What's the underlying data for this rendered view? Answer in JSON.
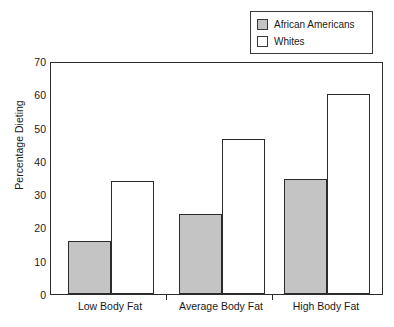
{
  "chart_data": {
    "type": "bar",
    "title": "",
    "subtitle": "",
    "xlabel": "",
    "ylabel": "Percentage Dieting",
    "categories": [
      "Low Body Fat",
      "Average Body Fat",
      "High Body Fat"
    ],
    "series": [
      {
        "name": "African Americans",
        "values": [
          16,
          24,
          34.5
        ],
        "color": "#c4c4c4"
      },
      {
        "name": "Whites",
        "values": [
          34,
          46.5,
          60
        ],
        "color": "#ffffff"
      }
    ],
    "ylim": [
      0,
      70
    ],
    "yticks": [
      0,
      10,
      20,
      30,
      40,
      50,
      60,
      70
    ],
    "ytick_labels": [
      "0",
      "10",
      "20",
      "30",
      "40",
      "50",
      "60",
      "70"
    ],
    "grid": false,
    "legend_position": "top-right",
    "legend_entries": [
      "African Americans",
      "Whites"
    ],
    "frame_color": "#2b2b2b",
    "bar_edge_color": "#2b2b2b",
    "text_color": "#1a1a1a",
    "background": "#ffffff"
  }
}
